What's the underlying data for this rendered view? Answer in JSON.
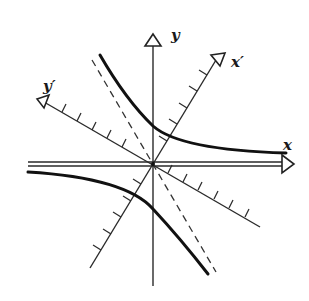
{
  "figure": {
    "labels": {
      "x": "x",
      "y": "y",
      "x_prime": "x′",
      "y_prime": "y′"
    },
    "elements": [
      "x-axis (horizontal, arrow right)",
      "y-axis (vertical, arrow up)",
      "x'-axis (rotated, arrow up-right, tick marks)",
      "y'-axis (rotated, arrow up-left, tick marks)",
      "dashed line through origin",
      "hyperbola upper-right branch",
      "hyperbola lower-left branch"
    ],
    "colors": {
      "ink": "#111111",
      "background": "#ffffff"
    }
  }
}
